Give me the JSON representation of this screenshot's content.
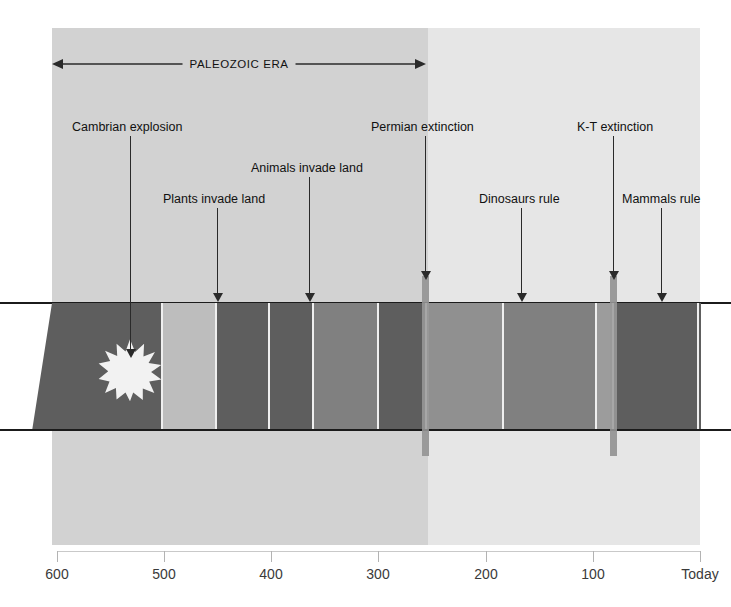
{
  "figure": {
    "width": 731,
    "height": 607,
    "background_color": "#ffffff"
  },
  "era_span": {
    "label": "PALEOZOIC ERA",
    "start_mya": 600,
    "end_mya": 250
  },
  "background_regions": [
    {
      "name": "paleozoic-background",
      "color": "#d2d2d2",
      "start_mya": 600,
      "end_mya": 250
    },
    {
      "name": "mesozoic-cenozoic-background",
      "color": "#e6e6e6",
      "start_mya": 250,
      "end_mya": 0
    }
  ],
  "annotations": [
    {
      "name": "cambrian-explosion",
      "label": "Cambrian explosion",
      "label_x": 72,
      "label_y": 120,
      "leader_x": 130,
      "leader_top": 136,
      "leader_bottom": 358,
      "arrow": true
    },
    {
      "name": "plants-invade-land",
      "label": "Plants invade land",
      "label_x": 163,
      "label_y": 192,
      "leader_x": 217,
      "leader_top": 208,
      "leader_bottom": 302,
      "arrow": true
    },
    {
      "name": "animals-invade-land",
      "label": "Animals invade land",
      "label_x": 251,
      "label_y": 161,
      "leader_x": 309,
      "leader_top": 177,
      "leader_bottom": 302,
      "arrow": true
    },
    {
      "name": "permian-extinction",
      "label": "Permian extinction",
      "label_x": 371,
      "label_y": 120,
      "leader_x": 425,
      "leader_top": 136,
      "leader_bottom": 280,
      "arrow": true
    },
    {
      "name": "dinosaurs-rule",
      "label": "Dinosaurs rule",
      "label_x": 479,
      "label_y": 192,
      "leader_x": 521,
      "leader_top": 208,
      "leader_bottom": 302,
      "arrow": true
    },
    {
      "name": "kt-extinction",
      "label": "K-T extinction",
      "label_x": 577,
      "label_y": 120,
      "leader_x": 613,
      "leader_top": 136,
      "leader_bottom": 280,
      "arrow": true
    },
    {
      "name": "mammals-rule",
      "label": "Mammals rule",
      "label_x": 622,
      "label_y": 192,
      "leader_x": 661,
      "leader_top": 208,
      "leader_bottom": 302,
      "arrow": true
    }
  ],
  "extinction_bars": [
    {
      "name": "permian-extinction-bar",
      "x": 422,
      "top": 276,
      "height": 180,
      "color": "#9a9a9a",
      "mya": 250
    },
    {
      "name": "kt-extinction-bar",
      "x": 610,
      "top": 276,
      "height": 180,
      "color": "#9a9a9a",
      "mya": 65
    }
  ],
  "band": {
    "name": "stratigraphic-band",
    "top": 303,
    "bottom": 431,
    "rule_color": "#1b1b1b",
    "separator_color": "#efefef",
    "segments": [
      {
        "name": "segment-1",
        "x": 32,
        "width": 130,
        "color": "#5e5e5e"
      },
      {
        "name": "segment-2",
        "x": 162,
        "width": 54,
        "color": "#bdbdbd"
      },
      {
        "name": "segment-3",
        "x": 216,
        "width": 53,
        "color": "#5e5e5e"
      },
      {
        "name": "segment-4",
        "x": 269,
        "width": 44,
        "color": "#5e5e5e"
      },
      {
        "name": "segment-5",
        "x": 313,
        "width": 65,
        "color": "#808080"
      },
      {
        "name": "segment-6",
        "x": 378,
        "width": 48,
        "color": "#5e5e5e"
      },
      {
        "name": "segment-7",
        "x": 426,
        "width": 77,
        "color": "#909090"
      },
      {
        "name": "segment-8",
        "x": 503,
        "width": 93,
        "color": "#808080"
      },
      {
        "name": "segment-9",
        "x": 596,
        "width": 17,
        "color": "#9c9c9c"
      },
      {
        "name": "segment-10",
        "x": 613,
        "width": 88,
        "color": "#5e5e5e"
      }
    ],
    "separators": [
      161,
      215,
      268,
      312,
      377,
      425,
      502,
      595,
      612,
      697
    ]
  },
  "starburst": {
    "name": "cambrian-explosion-starburst",
    "center_x": 130,
    "center_y": 370,
    "color": "#f2f2f2"
  },
  "axis": {
    "name": "time-axis",
    "unit": "millions of years ago",
    "line_color": "#c9c9c9",
    "ticks": [
      {
        "label": "600",
        "value": 600,
        "x": 57
      },
      {
        "label": "500",
        "value": 500,
        "x": 164
      },
      {
        "label": "400",
        "value": 400,
        "x": 271
      },
      {
        "label": "300",
        "value": 300,
        "x": 378
      },
      {
        "label": "200",
        "value": 200,
        "x": 486
      },
      {
        "label": "100",
        "value": 100,
        "x": 593
      },
      {
        "label": "Today",
        "value": 0,
        "x": 700
      }
    ]
  },
  "chart_data": {
    "type": "bar",
    "xlabel": "Millions of years ago",
    "ylabel": "",
    "xlim": [
      600,
      0
    ],
    "grid": false,
    "categories": [
      "600",
      "500",
      "400",
      "300",
      "200",
      "100",
      "Today"
    ],
    "values": [
      600,
      500,
      400,
      300,
      200,
      100,
      0
    ],
    "events": [
      {
        "name": "Cambrian explosion",
        "mya": 540
      },
      {
        "name": "Plants invade land",
        "mya": 450
      },
      {
        "name": "Animals invade land",
        "mya": 365
      },
      {
        "name": "Permian extinction",
        "mya": 250
      },
      {
        "name": "Dinosaurs rule",
        "mya": 160
      },
      {
        "name": "K-T extinction",
        "mya": 65
      },
      {
        "name": "Mammals rule",
        "mya": 20
      }
    ],
    "eras": [
      {
        "name": "PALEOZOIC ERA",
        "start_mya": 600,
        "end_mya": 250
      }
    ]
  }
}
